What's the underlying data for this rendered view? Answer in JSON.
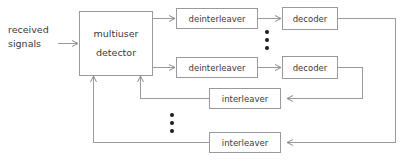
{
  "diagram": {
    "background_color": "#ffffff",
    "line_color": "#9a9a9a",
    "text_color": "#3a3a3a",
    "dot_color": "#1a1a1a",
    "input_label": {
      "line1": "received",
      "line2": "signals"
    },
    "blocks": {
      "detector": "multiuser\ndetector",
      "detector_line1": "multiuser",
      "detector_line2": "detector",
      "deinterleaver_1": "deinterleaver",
      "deinterleaver_2": "deinterleaver",
      "decoder_1": "decoder",
      "decoder_2": "decoder",
      "interleaver_1": "interleaver",
      "interleaver_2": "interleaver"
    },
    "ellipsis": {
      "between_branches": "vertical-dots",
      "between_interleavers": "vertical-dots",
      "dot_count": 3
    }
  }
}
